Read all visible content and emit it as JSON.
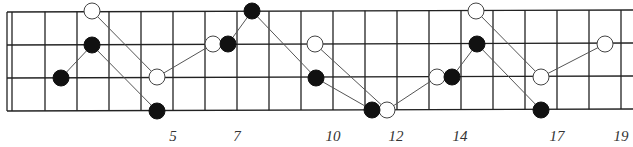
{
  "diagram": {
    "type": "guitar-fretboard-pattern",
    "colors": {
      "line": "#222222",
      "filled_dot": "#111111",
      "open_dot_fill": "#ffffff",
      "connector": "#555555"
    },
    "strings_y": [
      12,
      45,
      78,
      111
    ],
    "nut_x": [
      7,
      12
    ],
    "frets_x": [
      45,
      77,
      109,
      141,
      173,
      205,
      237,
      269,
      301,
      333,
      365,
      397,
      429,
      461,
      493,
      525,
      557,
      589,
      621
    ],
    "fret_labels": [
      {
        "text": "5",
        "x": 173
      },
      {
        "text": "7",
        "x": 237
      },
      {
        "text": "10",
        "x": 333
      },
      {
        "text": "12",
        "x": 396
      },
      {
        "text": "14",
        "x": 460
      },
      {
        "text": "17",
        "x": 557
      },
      {
        "text": "19",
        "x": 621
      }
    ],
    "filled_paths": [
      [
        [
          61,
          78
        ],
        [
          92,
          45
        ],
        [
          157,
          111
        ]
      ],
      [
        [
          228,
          44
        ],
        [
          252,
          11
        ],
        [
          316,
          78
        ],
        [
          372,
          110
        ]
      ],
      [
        [
          452,
          77
        ],
        [
          477,
          44
        ],
        [
          541,
          110
        ]
      ]
    ],
    "open_paths": [
      [
        [
          92,
          11
        ],
        [
          157,
          77
        ],
        [
          213,
          44
        ]
      ],
      [
        [
          315,
          44
        ],
        [
          387,
          110
        ],
        [
          437,
          77
        ]
      ],
      [
        [
          476,
          11
        ],
        [
          541,
          77
        ],
        [
          605,
          44
        ]
      ]
    ],
    "dot_radius": 8
  }
}
